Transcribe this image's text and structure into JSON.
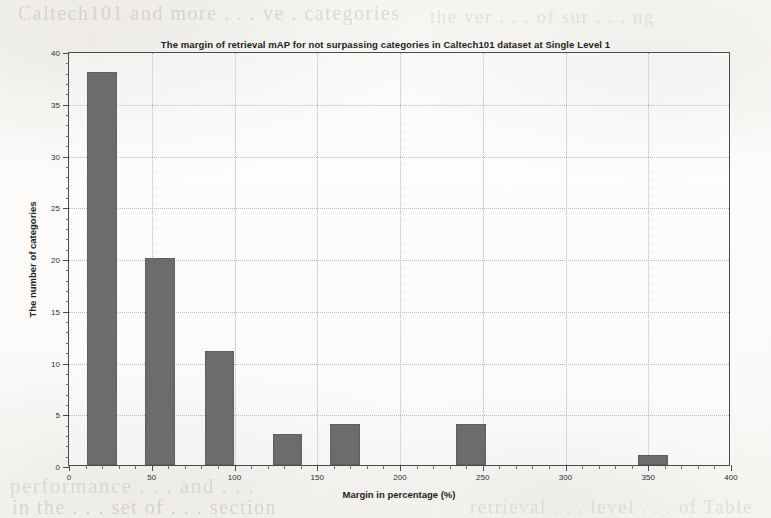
{
  "chart_data": {
    "type": "bar",
    "title": "The margin of retrieval mAP for not surpassing categories in Caltech101 dataset at Single Level 1",
    "xlabel": "Margin in percentage (%)",
    "ylabel": "The number of categories",
    "xlim": [
      0,
      400
    ],
    "ylim": [
      0,
      40
    ],
    "xticks": [
      0,
      50,
      100,
      150,
      200,
      250,
      300,
      350,
      400
    ],
    "xtick_labels": [
      "0",
      "50",
      "100",
      "150",
      "200",
      "250",
      "300",
      "350",
      "400"
    ],
    "yticks": [
      0,
      5,
      10,
      15,
      20,
      25,
      30,
      35,
      40
    ],
    "ytick_labels": [
      "0",
      "5",
      "10",
      "15",
      "20",
      "25",
      "30",
      "35",
      "40"
    ],
    "grid": true,
    "bar_color": "#6c6c6c",
    "bar_width": 18,
    "x": [
      20,
      55,
      91,
      132,
      167,
      243,
      353
    ],
    "values": [
      38,
      20,
      11,
      3,
      4,
      4,
      1
    ],
    "categories": [
      "20",
      "55",
      "91",
      "132",
      "167",
      "243",
      "353"
    ],
    "series": [
      {
        "name": "The number of categories",
        "values": [
          38,
          20,
          11,
          3,
          4,
          4,
          1
        ]
      }
    ],
    "legend": null,
    "legend_position": "none"
  },
  "scan_artifacts": {
    "ghost_lines": [
      "Caltech101 and more  . . . ve .  categories",
      "the ver . . . of  sur  . . .  ng",
      "performance  . . .  and  . . .",
      "in the  . . .  set of  . . .  section",
      "retrieval  . . .  level  . . .  of Table"
    ]
  }
}
